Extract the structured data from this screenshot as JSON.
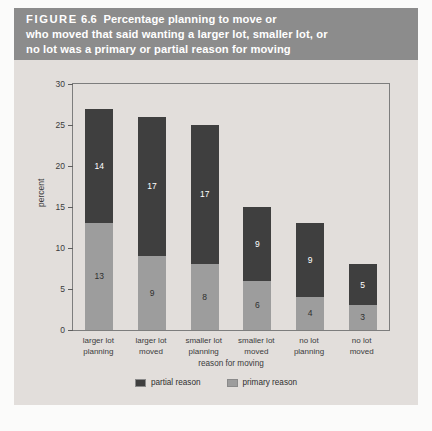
{
  "figure": {
    "label": "FIGURE",
    "number": "6.6",
    "title_lines": [
      "Percentage planning to move or",
      "who moved that said wanting a larger lot, smaller lot, or",
      "no lot was a primary or partial reason for moving"
    ],
    "title_full": "FIGURE 6.6 Percentage planning to move or who moved that said wanting a larger lot, smaller lot, or no lot was a primary or partial reason for moving"
  },
  "colors": {
    "band": "#8c8c8c",
    "panel": "#e2dedb",
    "partial": "#3f3f3f",
    "primary": "#9d9d9d",
    "frame": "#7d7d7d",
    "text": "#3b3b3b"
  },
  "chart_data": {
    "type": "bar",
    "stacked": true,
    "title": "Percentage planning to move or who moved that said wanting a larger lot, smaller lot, or no lot was a primary or partial reason for moving",
    "xlabel": "reason for moving",
    "ylabel": "percent",
    "ylim": [
      0,
      30
    ],
    "yticks": [
      0,
      5,
      10,
      15,
      20,
      25,
      30
    ],
    "ytick_labels": [
      "0",
      "5",
      "10",
      "15",
      "20",
      "25",
      "30"
    ],
    "grid": false,
    "legend_position": "bottom-center",
    "categories": [
      "larger lot planning",
      "larger lot moved",
      "smaller lot planning",
      "smaller lot moved",
      "no lot planning",
      "no lot moved"
    ],
    "category_lines": [
      [
        "larger lot",
        "planning"
      ],
      [
        "larger lot",
        "moved"
      ],
      [
        "smaller lot",
        "planning"
      ],
      [
        "smaller lot",
        "moved"
      ],
      [
        "no lot",
        "planning"
      ],
      [
        "no lot",
        "moved"
      ]
    ],
    "series": [
      {
        "name": "primary reason",
        "color": "#9d9d9d",
        "values": [
          13,
          9,
          8,
          6,
          4,
          3
        ]
      },
      {
        "name": "partial reason",
        "color": "#3f3f3f",
        "values": [
          14,
          17,
          17,
          9,
          9,
          5
        ]
      }
    ],
    "totals": [
      27,
      26,
      25,
      15,
      13,
      8
    ],
    "legend": [
      {
        "label": "partial reason",
        "color": "#3f3f3f"
      },
      {
        "label": "primary reason",
        "color": "#9d9d9d"
      }
    ]
  }
}
